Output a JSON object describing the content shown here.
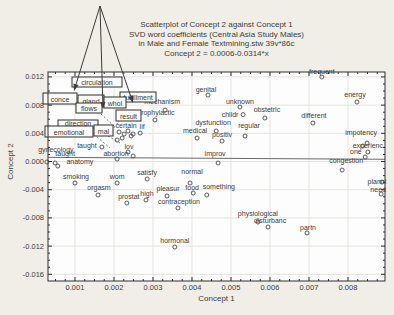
{
  "colors": {
    "background": "#f1eee7",
    "plot_background": "#fdfdfd",
    "axis": "#2e2e2e",
    "text": "#3c3c3c",
    "grid": "#e7e4dd",
    "marker": "#4a4a4a",
    "regression_line": "#6a6a6a",
    "annotation_box_fill": "#fbfaf6"
  },
  "title_lines": [
    "Scatterplot of Concept 2 against Concept 1",
    "SVD word coefficients (Central Asia Study Males)",
    "in Male and Female Textmining.stw 39v*86c",
    "Concept 2 = 0.0006-0.0314*x"
  ],
  "axes": {
    "x_label": "Concept 1",
    "y_label": "Concept 2",
    "x_range": [
      0.000308,
      0.008949
    ],
    "y_range": [
      -0.01695,
      0.0127
    ],
    "x_major_ticks": [
      0.001,
      0.002,
      0.003,
      0.004,
      0.005,
      0.006,
      0.007,
      0.008
    ],
    "y_major_ticks": [
      0.012,
      0.008,
      0.004,
      0.0,
      -0.004,
      -0.008,
      -0.012,
      -0.016
    ],
    "x_minor_step": 0.00025,
    "y_minor_step": 0.001,
    "tick_decimals": 3
  },
  "chart_data": {
    "type": "scatter",
    "title": "Scatterplot of Concept 2 against Concept 1",
    "subtitle": "SVD word coefficients (Central Asia Study Males) in Male and Female Textmining.stw 39v*86c",
    "equation": "Concept 2 = 0.0006-0.0314*x",
    "xlabel": "Concept 1",
    "ylabel": "Concept 2",
    "xlim": [
      0.000308,
      0.008949
    ],
    "ylim": [
      -0.01695,
      0.0127
    ],
    "grid": "major-light",
    "regression": {
      "intercept": 0.0006,
      "slope": -0.0314
    },
    "points": [
      {
        "label": "frequent",
        "x": 0.00733,
        "y": 0.01199,
        "dx": 0,
        "dy": -3
      },
      {
        "label": "energy",
        "x": 0.00823,
        "y": 0.00844,
        "dx": -2,
        "dy": -5
      },
      {
        "label": "genital",
        "x": 0.00441,
        "y": 0.00943,
        "dx": -2,
        "dy": -3
      },
      {
        "label": "unknown",
        "x": 0.00523,
        "y": 0.00773,
        "dx": 0,
        "dy": -3
      },
      {
        "label": "childr",
        "x": 0.00531,
        "y": 0.00666,
        "dx": -13,
        "dy": 2.5
      },
      {
        "label": "obstetric",
        "x": 0.00587,
        "y": 0.00617,
        "dx": 2,
        "dy": -6
      },
      {
        "label": "different",
        "x": 0.0071,
        "y": 0.00546,
        "dx": 1,
        "dy": -5
      },
      {
        "label": "mechanism",
        "x": 0.00331,
        "y": 0.0073,
        "dx": -3,
        "dy": -6
      },
      {
        "label": "prophylactic",
        "x": 0.00305,
        "y": 0.00589,
        "dx": 1,
        "dy": -5
      },
      {
        "label": "dysfunction",
        "x": 0.00462,
        "y": 0.00433,
        "dx": -3,
        "dy": -6
      },
      {
        "label": "regular",
        "x": 0.00536,
        "y": 0.00362,
        "dx": 4,
        "dy": -8
      },
      {
        "label": "medical",
        "x": 0.00413,
        "y": 0.00333,
        "dx": -2,
        "dy": -5
      },
      {
        "label": "positiv",
        "x": 0.00477,
        "y": 0.00291,
        "dx": 0,
        "dy": -4
      },
      {
        "label": "improv",
        "x": 0.00467,
        "y": -0.00021,
        "dx": -3,
        "dy": -7
      },
      {
        "label": "impotency",
        "x": 0.00849,
        "y": 0.00262,
        "dx": -6,
        "dy": -8
      },
      {
        "label": "experienc",
        "x": 0.00838,
        "y": 0.0022,
        "dx": 5,
        "dy": 2
      },
      {
        "label": "one",
        "x": 0.00851,
        "y": 0.00135,
        "dx": -12,
        "dy": 2
      },
      {
        "label": "congestion",
        "x": 0.00785,
        "y": -0.00121,
        "dx": 4,
        "dy": -7
      },
      {
        "label": "planni",
        "x": 0.00887,
        "y": -0.00291,
        "dx": -5,
        "dy": 2
      },
      {
        "label": "need",
        "x": 0.00885,
        "y": -0.00461,
        "dx": -3,
        "dy": -2
      },
      {
        "label": "partn",
        "x": 0.00695,
        "y": -0.01014,
        "dx": 1,
        "dy": -3
      },
      {
        "label": "physiological",
        "x": 0.00569,
        "y": -0.00858,
        "dx": 0,
        "dy": -6
      },
      {
        "label": "disturbanc",
        "x": 0.00595,
        "y": -0.00929,
        "dx": 2,
        "dy": -4
      },
      {
        "label": "hormonal",
        "x": 0.00356,
        "y": -0.01213,
        "dx": 0,
        "dy": -4
      },
      {
        "label": "prostat",
        "x": 0.00233,
        "y": -0.00589,
        "dx": 2,
        "dy": -4
      },
      {
        "label": "orgasm",
        "x": 0.00159,
        "y": -0.00475,
        "dx": 1,
        "dy": -5
      },
      {
        "label": "high",
        "x": 0.00282,
        "y": -0.00546,
        "dx": 1,
        "dy": -4
      },
      {
        "label": "contraception",
        "x": 0.00364,
        "y": -0.0066,
        "dx": 1,
        "dy": -4
      },
      {
        "label": "pleasur",
        "x": 0.00336,
        "y": -0.00489,
        "dx": 1,
        "dy": -5
      },
      {
        "label": "food",
        "x": 0.00403,
        "y": -0.00447,
        "dx": -1,
        "dy": -3
      },
      {
        "label": "something",
        "x": 0.00438,
        "y": -0.00475,
        "dx": 12,
        "dy": -6
      },
      {
        "label": "normal",
        "x": 0.00395,
        "y": -0.00305,
        "dx": 2,
        "dy": -9
      },
      {
        "label": "satisfy",
        "x": 0.00285,
        "y": -0.00248,
        "dx": 0,
        "dy": -4
      },
      {
        "label": "wom",
        "x": 0.00208,
        "y": -0.00305,
        "dx": 0,
        "dy": -4
      },
      {
        "label": "smoking",
        "x": 0.001,
        "y": -0.00305,
        "dx": 1,
        "dy": -4
      },
      {
        "label": "taught",
        "x": 0.00169,
        "y": 0.00206,
        "dx": -15,
        "dy": 1
      },
      {
        "label": "lov",
        "x": 0.00236,
        "y": 0.00135,
        "dx": 1,
        "dy": -3
      },
      {
        "label": "abortion",
        "x": 0.00249,
        "y": 0.00078,
        "dx": -17,
        "dy": 0
      },
      {
        "label": "gynecology",
        "x": 0.00028,
        "y": -7e-05,
        "dx": 9,
        "dy": -10
      },
      {
        "label": "taught",
        "x": 0.00049,
        "y": -0.00021,
        "dx": 10,
        "dy": -7
      },
      {
        "label": "anatomy",
        "x": 0.00056,
        "y": -0.00064,
        "dx": 22,
        "dy": -2
      },
      {
        "label": "certain",
        "x": 0.00226,
        "y": 0.0039,
        "dx": 2,
        "dy": -6
      },
      {
        "label": "lif",
        "x": 0.00267,
        "y": 0.00404,
        "dx": 2,
        "dy": -4
      }
    ],
    "unlabeled_points": [
      [
        0.00213,
        0.00418
      ],
      [
        0.00236,
        0.00433
      ],
      [
        0.00244,
        0.00362
      ],
      [
        0.00221,
        0.00333
      ],
      [
        0.00249,
        0.0039
      ],
      [
        0.00208,
        0.00305
      ],
      [
        0.00208,
        0.00036
      ],
      [
        0.00844,
        0.00064
      ]
    ],
    "boxed_labels": [
      {
        "label": "circulation",
        "px": 72,
        "py": 77,
        "w": 50,
        "h": 10
      },
      {
        "label": "conce",
        "px": 43,
        "py": 93,
        "w": 34,
        "h": 11
      },
      {
        "label": "fulfillment",
        "px": 120,
        "py": 92,
        "w": 36,
        "h": 10
      },
      {
        "label": "gland",
        "px": 78,
        "py": 95,
        "w": 26,
        "h": 11
      },
      {
        "label": "whol",
        "px": 104,
        "py": 97,
        "w": 22,
        "h": 11
      },
      {
        "label": "flows",
        "px": 76,
        "py": 103,
        "w": 26,
        "h": 10
      },
      {
        "label": "result",
        "px": 116,
        "py": 110,
        "w": 25,
        "h": 11
      },
      {
        "label": "direction",
        "px": 58,
        "py": 120,
        "w": 40,
        "h": 8
      },
      {
        "label": "emotional",
        "px": 45,
        "py": 126,
        "w": 48,
        "h": 11
      },
      {
        "label": "mal",
        "px": 94,
        "py": 125,
        "w": 19,
        "h": 11
      }
    ],
    "annotation_arrows": {
      "apex": [
        100,
        6
      ],
      "targets": [
        [
          74,
          91
        ],
        [
          103,
          109
        ],
        [
          133,
          103
        ]
      ]
    },
    "dashed_connectors": [
      [
        [
          97,
          137
        ],
        [
          110,
          148
        ]
      ],
      [
        [
          108,
          136
        ],
        [
          120,
          143
        ]
      ],
      [
        [
          101,
          114
        ],
        [
          115,
          127
        ]
      ],
      [
        [
          120,
          120
        ],
        [
          112,
          130
        ]
      ]
    ]
  }
}
